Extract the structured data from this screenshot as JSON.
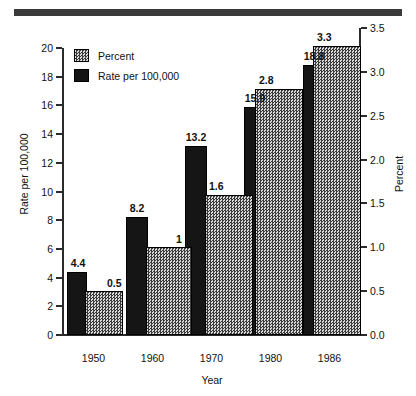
{
  "banner": {
    "name": "top-rule"
  },
  "chart_data": {
    "type": "bar",
    "title": "",
    "xlabel": "Year",
    "categories": [
      "1950",
      "1960",
      "1970",
      "1980",
      "1986"
    ],
    "series": [
      {
        "name": "Rate per 100,000",
        "axis": "left",
        "values": [
          4.4,
          8.2,
          13.2,
          15.9,
          18.8
        ],
        "labels": [
          "4.4",
          "8.2",
          "13.2",
          "15.9",
          "18.8"
        ],
        "color": "#151515",
        "fill": "solid-black"
      },
      {
        "name": "Percent",
        "axis": "right",
        "values": [
          0.5,
          1.0,
          1.6,
          2.8,
          3.3
        ],
        "labels": [
          "0.5",
          "1",
          "1.6",
          "2.8",
          "3.3"
        ],
        "color": "#bdbdbd",
        "fill": "stipple-gray"
      }
    ],
    "left_axis": {
      "label": "Rate per 100,000",
      "ylim": [
        0,
        20
      ],
      "ticks": [
        "0",
        "2",
        "4",
        "6",
        "8",
        "10",
        "12",
        "14",
        "16",
        "18",
        "20"
      ],
      "tickvalues": [
        0,
        2,
        4,
        6,
        8,
        10,
        12,
        14,
        16,
        18,
        20
      ]
    },
    "right_axis": {
      "label": "Percent",
      "ylim": [
        0.0,
        3.5
      ],
      "ticks": [
        "0.0",
        "0.5",
        "1.0",
        "1.5",
        "2.0",
        "2.5",
        "3.0",
        "3.5"
      ],
      "tickvalues": [
        0.0,
        0.5,
        1.0,
        1.5,
        2.0,
        2.5,
        3.0,
        3.5
      ]
    },
    "grid": false,
    "legend": {
      "position": "top-left",
      "entries": [
        {
          "label": "Percent",
          "swatch": "stipple-gray"
        },
        {
          "label": "Rate per 100,000",
          "swatch": "solid-black"
        }
      ]
    }
  }
}
